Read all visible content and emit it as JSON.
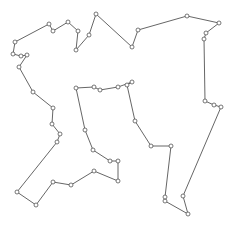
{
  "chart_data": {
    "type": "line",
    "title": "",
    "xlabel": "",
    "ylabel": "",
    "grid": false,
    "legend": null,
    "axes_visible": false,
    "xlim": [
      0,
      236
    ],
    "ylim": [
      233,
      0
    ],
    "series": [
      {
        "name": "closed-tour",
        "closed": true,
        "color": "#555555",
        "marker": "open-circle",
        "points": [
          [
            15,
            42
          ],
          [
            49,
            24
          ],
          [
            53,
            31
          ],
          [
            68,
            22
          ],
          [
            78,
            31
          ],
          [
            76,
            50
          ],
          [
            89,
            35
          ],
          [
            96,
            14
          ],
          [
            132,
            47
          ],
          [
            138,
            30
          ],
          [
            187,
            16
          ],
          [
            219,
            23
          ],
          [
            206,
            33
          ],
          [
            204,
            39
          ],
          [
            205,
            101
          ],
          [
            214,
            105
          ],
          [
            221,
            107
          ],
          [
            183,
            196
          ],
          [
            188,
            214
          ],
          [
            165,
            201
          ],
          [
            165,
            197
          ],
          [
            171,
            146
          ],
          [
            151,
            146
          ],
          [
            135,
            121
          ],
          [
            127,
            85
          ],
          [
            132,
            82
          ],
          [
            118,
            87
          ],
          [
            100,
            90
          ],
          [
            94,
            87
          ],
          [
            76,
            88
          ],
          [
            85,
            130
          ],
          [
            93,
            150
          ],
          [
            110,
            161
          ],
          [
            118,
            161
          ],
          [
            118,
            181
          ],
          [
            94,
            171
          ],
          [
            71,
            185
          ],
          [
            53,
            182
          ],
          [
            36,
            205
          ],
          [
            17,
            192
          ],
          [
            57,
            142
          ],
          [
            60,
            134
          ],
          [
            52,
            124
          ],
          [
            53,
            108
          ],
          [
            33,
            92
          ],
          [
            19,
            67
          ],
          [
            27,
            55
          ],
          [
            21,
            56
          ],
          [
            13,
            54
          ]
        ]
      }
    ]
  }
}
